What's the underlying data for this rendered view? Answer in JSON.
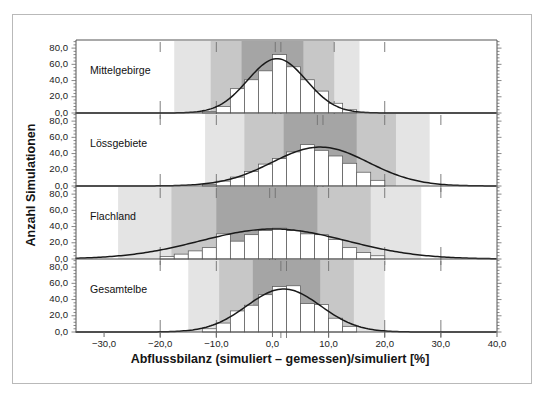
{
  "figure": {
    "kind": "multi-panel-histogram-figure",
    "background_color": "#ffffff",
    "frame_color": "#b9b9b9"
  },
  "axes": {
    "y_title": "Anzahl Simulationen",
    "x_title": "Abflussbilanz (simuliert – gemessen)/simuliert [%]",
    "y_ticks": [
      "0,0",
      "20,0",
      "40,0",
      "60,0",
      "80,0"
    ],
    "x_ticks": [
      "−30,0",
      "−20,0",
      "−10,0",
      "0,0",
      "10,0",
      "20,0",
      "30,0",
      "40,0"
    ]
  },
  "colors": {
    "band_light": "#e4e4e4",
    "band_mid": "#c7c7c7",
    "band_dark": "#a5a5a5",
    "bar_fill": "#ffffff",
    "bar_stroke": "#5a5a5a",
    "curve": "#1a1a1a",
    "axis": "#808080",
    "tick": "#6a6a6a",
    "marker": "#707070"
  },
  "chart_data": {
    "type": "bar",
    "title": "",
    "subtitle": "",
    "xlabel": "Abflussbilanz (simuliert – gemessen)/simuliert [%]",
    "ylabel": "Anzahl Simulationen",
    "xlim": [
      -35.0,
      40.0
    ],
    "ylim": [
      0.0,
      90.0
    ],
    "x_tick_values": [
      -30.0,
      -20.0,
      -10.0,
      0.0,
      10.0,
      20.0,
      30.0,
      40.0
    ],
    "y_tick_values": [
      0.0,
      20.0,
      40.0,
      60.0,
      80.0
    ],
    "grid": false,
    "legend": "none",
    "bin_width": 2.5,
    "panels": [
      {
        "label": "Mittelgebirge",
        "bin_left_edges": [
          -12.5,
          -10.0,
          -7.5,
          -5.0,
          -2.5,
          0.0,
          2.5,
          5.0,
          7.5,
          10.0,
          12.5
        ],
        "values": [
          2,
          8,
          30,
          41,
          52,
          72,
          57,
          41,
          27,
          12,
          4
        ],
        "curve_peak_x": 0.8,
        "curve_peak_y": 67.0,
        "curve_sigma": 5.2,
        "bands": [
          {
            "name": "outer",
            "from": -17.5,
            "to": 15.5,
            "shade": "band_light"
          },
          {
            "name": "middle",
            "from": -11.0,
            "to": 11.0,
            "shade": "band_mid"
          },
          {
            "name": "inner",
            "from": -5.5,
            "to": 5.5,
            "shade": "band_dark"
          }
        ],
        "markers_x": [
          -20.0,
          -10.0,
          0.5,
          1.5,
          11.0,
          20.0
        ]
      },
      {
        "label": "Lössgebiete",
        "bin_left_edges": [
          -12.5,
          -10.0,
          -7.5,
          -5.0,
          -2.5,
          0.0,
          2.5,
          5.0,
          7.5,
          10.0,
          12.5,
          15.0,
          17.5
        ],
        "values": [
          2,
          6,
          11,
          18,
          27,
          34,
          42,
          51,
          44,
          37,
          28,
          17,
          7
        ],
        "curve_peak_x": 8.5,
        "curve_peak_y": 48.0,
        "curve_sigma": 8.6,
        "bands": [
          {
            "name": "outer",
            "from": -12.0,
            "to": 28.0,
            "shade": "band_light"
          },
          {
            "name": "middle",
            "from": -5.0,
            "to": 22.0,
            "shade": "band_mid"
          },
          {
            "name": "inner",
            "from": 2.0,
            "to": 15.0,
            "shade": "band_dark"
          }
        ],
        "markers_x": [
          -20.0,
          -10.0,
          8.0,
          9.0,
          20.0,
          30.0
        ]
      },
      {
        "label": "Flachland",
        "bin_left_edges": [
          -20.0,
          -17.5,
          -15.0,
          -12.5,
          -10.0,
          -7.5,
          -5.0,
          -2.5,
          0.0,
          2.5,
          5.0,
          7.5,
          10.0,
          12.5,
          15.0,
          17.5
        ],
        "values": [
          3,
          6,
          10,
          14,
          31,
          22,
          30,
          35,
          38,
          35,
          31,
          30,
          24,
          14,
          8,
          4
        ],
        "curve_peak_x": 0.2,
        "curve_peak_y": 37.0,
        "curve_sigma": 13.0,
        "bands": [
          {
            "name": "outer",
            "from": -27.5,
            "to": 26.5,
            "shade": "band_light"
          },
          {
            "name": "middle",
            "from": -18.0,
            "to": 17.5,
            "shade": "band_mid"
          },
          {
            "name": "inner",
            "from": -10.0,
            "to": 8.0,
            "shade": "band_dark"
          }
        ],
        "markers_x": [
          -20.0,
          -10.0,
          -0.5,
          0.5,
          10.0,
          20.0,
          30.0
        ]
      },
      {
        "label": "Gesamtelbe",
        "bin_left_edges": [
          -12.5,
          -10.0,
          -7.5,
          -5.0,
          -2.5,
          0.0,
          2.5,
          5.0,
          7.5,
          10.0,
          12.5
        ],
        "values": [
          4,
          11,
          26,
          33,
          46,
          56,
          57,
          35,
          34,
          17,
          7
        ],
        "curve_peak_x": 2.0,
        "curve_peak_y": 53.0,
        "curve_sigma": 6.6,
        "bands": [
          {
            "name": "outer",
            "from": -15.0,
            "to": 20.0,
            "shade": "band_light"
          },
          {
            "name": "middle",
            "from": -9.5,
            "to": 14.5,
            "shade": "band_mid"
          },
          {
            "name": "inner",
            "from": -3.5,
            "to": 8.5,
            "shade": "band_dark"
          }
        ],
        "markers_x": [
          -20.0,
          -10.0,
          1.5,
          2.5,
          10.0,
          20.0,
          30.0
        ]
      }
    ]
  }
}
